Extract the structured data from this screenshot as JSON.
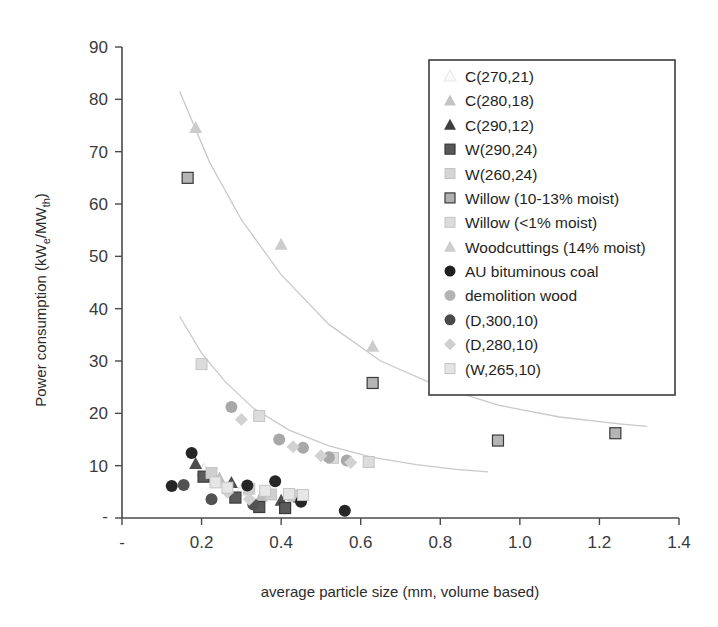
{
  "chart_data": {
    "type": "scatter",
    "title": "",
    "xlabel": "average particle size (mm, volume based)",
    "ylabel": "Power consumption (kWe/MWth)",
    "ylabel_parts": {
      "pre": "Power consumption (kW",
      "sub1": "e",
      "mid": "/MW",
      "sub2": "th",
      "post": ")"
    },
    "xlim": [
      0,
      1.4
    ],
    "ylim": [
      0,
      90
    ],
    "grid": false,
    "legend_position": "upper-right-inside",
    "xticks": [
      "-",
      "0.2",
      "0.4",
      "0.6",
      "0.8",
      "1.0",
      "1.2",
      "1.4"
    ],
    "xtick_values": [
      0,
      0.2,
      0.4,
      0.6,
      0.8,
      1.0,
      1.2,
      1.4
    ],
    "yticks": [
      "-",
      "10",
      "20",
      "30",
      "40",
      "50",
      "60",
      "70",
      "80",
      "90"
    ],
    "ytick_values": [
      0,
      10,
      20,
      30,
      40,
      50,
      60,
      70,
      80,
      90
    ],
    "series": [
      {
        "name": "C(270,21)",
        "marker": "triangle-open",
        "color": "#e3e3e3",
        "points": [
          [
            0.205,
            9.2
          ],
          [
            0.3,
            5.3
          ],
          [
            0.355,
            4.6
          ]
        ]
      },
      {
        "name": "C(280,18)",
        "marker": "triangle-light",
        "color": "#bdbdbd",
        "points": [
          [
            0.245,
            7.6
          ],
          [
            0.35,
            4.2
          ],
          [
            0.43,
            4.2
          ]
        ]
      },
      {
        "name": "C(290,12)",
        "marker": "triangle-filled",
        "color": "#4d4d4d",
        "points": [
          [
            0.185,
            10.4
          ],
          [
            0.275,
            6.8
          ],
          [
            0.4,
            3.4
          ],
          [
            0.445,
            4.0
          ]
        ]
      },
      {
        "name": "W(290,24)",
        "marker": "square-dark",
        "color": "#5a5a5a",
        "points": [
          [
            0.205,
            7.9
          ],
          [
            0.285,
            3.9
          ],
          [
            0.345,
            2.1
          ],
          [
            0.41,
            1.9
          ]
        ]
      },
      {
        "name": "W(260,24)",
        "marker": "square-light",
        "color": "#cfcfcf",
        "points": [
          [
            0.225,
            8.6
          ],
          [
            0.32,
            5.6
          ],
          [
            0.375,
            4.5
          ],
          [
            0.435,
            4.3
          ]
        ]
      },
      {
        "name": "Willow (10-13% moist)",
        "marker": "square-mid",
        "color": "#b5b5b5",
        "points": [
          [
            0.165,
            65.0
          ],
          [
            0.63,
            25.8
          ],
          [
            0.945,
            14.8
          ],
          [
            1.24,
            16.2
          ]
        ]
      },
      {
        "name": "Willow (<1% moist)",
        "marker": "square-pale",
        "color": "#dcdcdc",
        "points": [
          [
            0.2,
            29.4
          ],
          [
            0.345,
            19.5
          ],
          [
            0.53,
            11.5
          ],
          [
            0.62,
            10.7
          ]
        ]
      },
      {
        "name": "Woodcuttings (14% moist)",
        "marker": "triangle-pale",
        "color": "#cccccc",
        "points": [
          [
            0.185,
            74.6
          ],
          [
            0.4,
            52.3
          ],
          [
            0.63,
            32.8
          ]
        ]
      },
      {
        "name": "AU bituminous coal",
        "marker": "circle-black",
        "color": "#262626",
        "points": [
          [
            0.175,
            12.4
          ],
          [
            0.125,
            6.1
          ],
          [
            0.315,
            6.2
          ],
          [
            0.385,
            7.0
          ],
          [
            0.45,
            3.1
          ],
          [
            0.56,
            1.4
          ]
        ]
      },
      {
        "name": "demolition wood",
        "marker": "circle-grey",
        "color": "#a8a8a8",
        "points": [
          [
            0.275,
            21.2
          ],
          [
            0.395,
            15.0
          ],
          [
            0.455,
            13.4
          ],
          [
            0.52,
            11.6
          ],
          [
            0.565,
            11.0
          ]
        ]
      },
      {
        "name": "(D,300,10)",
        "marker": "circle-darkgrey",
        "color": "#525252",
        "points": [
          [
            0.155,
            6.3
          ],
          [
            0.225,
            3.6
          ],
          [
            0.33,
            2.6
          ]
        ]
      },
      {
        "name": "(D,280,10)",
        "marker": "diamond-light",
        "color": "#d2d2d2",
        "points": [
          [
            0.3,
            18.8
          ],
          [
            0.43,
            13.6
          ],
          [
            0.5,
            11.9
          ],
          [
            0.575,
            10.6
          ],
          [
            0.265,
            4.9
          ],
          [
            0.32,
            3.6
          ]
        ]
      },
      {
        "name": "(W,265,10)",
        "marker": "square-vpale",
        "color": "#e6e6e6",
        "points": [
          [
            0.235,
            6.8
          ],
          [
            0.265,
            5.8
          ],
          [
            0.36,
            5.2
          ],
          [
            0.42,
            4.6
          ],
          [
            0.455,
            4.4
          ]
        ]
      }
    ],
    "trendlines": [
      {
        "name": "upper-trend",
        "color": "#c9c9c9",
        "points": [
          [
            0.145,
            81.5
          ],
          [
            0.22,
            68.0
          ],
          [
            0.3,
            57.0
          ],
          [
            0.4,
            46.5
          ],
          [
            0.52,
            37.0
          ],
          [
            0.65,
            30.0
          ],
          [
            0.8,
            25.0
          ],
          [
            0.95,
            21.5
          ],
          [
            1.1,
            19.3
          ],
          [
            1.25,
            18.0
          ],
          [
            1.32,
            17.5
          ]
        ]
      },
      {
        "name": "lower-trend",
        "color": "#c9c9c9",
        "points": [
          [
            0.145,
            38.5
          ],
          [
            0.2,
            31.5
          ],
          [
            0.26,
            26.0
          ],
          [
            0.33,
            21.0
          ],
          [
            0.42,
            16.8
          ],
          [
            0.52,
            13.8
          ],
          [
            0.63,
            11.6
          ],
          [
            0.74,
            10.2
          ],
          [
            0.84,
            9.3
          ],
          [
            0.92,
            8.8
          ]
        ]
      }
    ]
  },
  "legend": {
    "items": [
      {
        "label": "C(270,21)",
        "marker": "triangle-open",
        "color": "#e8e8e8"
      },
      {
        "label": "C(280,18)",
        "marker": "triangle-light",
        "color": "#c4c4c4"
      },
      {
        "label": "C(290,12)",
        "marker": "triangle-filled",
        "color": "#3f3f3f"
      },
      {
        "label": "W(290,24)",
        "marker": "square-dark",
        "color": "#585858"
      },
      {
        "label": "W(260,24)",
        "marker": "square-light",
        "color": "#d5d5d5"
      },
      {
        "label": "Willow (10-13% moist)",
        "marker": "square-mid",
        "color": "#b0b0b0"
      },
      {
        "label": "Willow (<1% moist)",
        "marker": "square-pale",
        "color": "#dcdcdc"
      },
      {
        "label": "Woodcuttings (14% moist)",
        "marker": "triangle-pale",
        "color": "#cdcdcd"
      },
      {
        "label": "AU bituminous coal",
        "marker": "circle-black",
        "color": "#1f1f1f"
      },
      {
        "label": "demolition wood",
        "marker": "circle-grey",
        "color": "#b3b3b3"
      },
      {
        "label": "(D,300,10)",
        "marker": "circle-darkgrey",
        "color": "#4a4a4a"
      },
      {
        "label": "(D,280,10)",
        "marker": "diamond-light",
        "color": "#cfcfcf"
      },
      {
        "label": "(W,265,10)",
        "marker": "square-vpale",
        "color": "#e4e4e4"
      }
    ]
  }
}
